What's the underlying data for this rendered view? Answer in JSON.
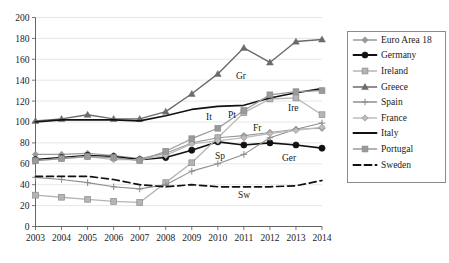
{
  "chart_data": {
    "type": "line",
    "title": "",
    "xlabel": "",
    "ylabel": "",
    "categories": [
      "2003",
      "2004",
      "2005",
      "2006",
      "2007",
      "2008",
      "2009",
      "2010",
      "2011",
      "2012",
      "2013",
      "2014"
    ],
    "x": [
      2003,
      2004,
      2005,
      2006,
      2007,
      2008,
      2009,
      2010,
      2011,
      2012,
      2013,
      2014
    ],
    "ylim": [
      0,
      200
    ],
    "ytick_step": 20,
    "yticks": [
      0,
      20,
      40,
      60,
      80,
      100,
      120,
      140,
      160,
      180,
      200
    ],
    "grid": true,
    "legend_position": "right",
    "series": [
      {
        "name": "Euro Area 18",
        "short": "",
        "color": "#9a9a9a",
        "marker": "diamond",
        "dash": "none",
        "width": 1.1,
        "values": [
          69,
          69,
          70,
          68,
          65,
          70,
          80,
          85,
          87,
          90,
          93,
          94
        ]
      },
      {
        "name": "Germany",
        "short": "Ger",
        "color": "#111111",
        "marker": "circle",
        "dash": "none",
        "width": 1.6,
        "values": [
          64,
          66,
          68,
          67,
          64,
          66,
          73,
          81,
          78,
          80,
          78,
          75
        ]
      },
      {
        "name": "Ireland",
        "short": "Ire",
        "color": "#b5b5b5",
        "marker": "square",
        "dash": "none",
        "width": 1.3,
        "values": [
          30,
          28,
          26,
          24,
          23,
          42,
          61,
          85,
          109,
          122,
          123,
          107
        ]
      },
      {
        "name": "Greece",
        "short": "Gr",
        "color": "#6b6b6b",
        "marker": "triangle",
        "dash": "none",
        "width": 1.4,
        "values": [
          101,
          103,
          107,
          103,
          103,
          110,
          127,
          146,
          171,
          157,
          177,
          179
        ]
      },
      {
        "name": "Spain",
        "short": "Sp",
        "color": "#8f8f8f",
        "marker": "plus",
        "dash": "none",
        "width": 1.1,
        "values": [
          47,
          45,
          42,
          38,
          36,
          40,
          53,
          60,
          69,
          85,
          93,
          99
        ]
      },
      {
        "name": "France",
        "short": "Fr",
        "color": "#bdbdbd",
        "marker": "diamond",
        "dash": "none",
        "width": 1.3,
        "values": [
          63,
          65,
          67,
          64,
          64,
          68,
          79,
          82,
          85,
          89,
          92,
          95
        ]
      },
      {
        "name": "Italy",
        "short": "It",
        "color": "#111111",
        "marker": "none",
        "dash": "none",
        "width": 1.7,
        "values": [
          100,
          102,
          102,
          102,
          101,
          106,
          112,
          115,
          116,
          123,
          128,
          132
        ]
      },
      {
        "name": "Portugal",
        "short": "Pt",
        "color": "#9a9a9a",
        "marker": "square",
        "dash": "none",
        "width": 1.3,
        "values": [
          63,
          65,
          67,
          66,
          63,
          72,
          84,
          94,
          111,
          126,
          129,
          130
        ]
      },
      {
        "name": "Sweden",
        "short": "Sw",
        "color": "#111111",
        "marker": "none",
        "dash": "dashed",
        "width": 1.7,
        "values": [
          48,
          48,
          48,
          45,
          40,
          38,
          40,
          38,
          38,
          38,
          39,
          44
        ]
      }
    ],
    "annotations": [
      {
        "text": "Gr",
        "x": 236,
        "y": 79
      },
      {
        "text": "It",
        "x": 206,
        "y": 120
      },
      {
        "text": "Pt",
        "x": 228,
        "y": 118
      },
      {
        "text": "Fr",
        "x": 253,
        "y": 131
      },
      {
        "text": "Ire",
        "x": 288,
        "y": 111
      },
      {
        "text": "Sp",
        "x": 215,
        "y": 159
      },
      {
        "text": "Ger",
        "x": 282,
        "y": 161
      },
      {
        "text": "Sw",
        "x": 238,
        "y": 198
      }
    ]
  },
  "legend": {
    "items": [
      {
        "label": "Euro Area 18"
      },
      {
        "label": "Germany"
      },
      {
        "label": "Ireland"
      },
      {
        "label": "Greece"
      },
      {
        "label": "Spain"
      },
      {
        "label": "France"
      },
      {
        "label": "Italy"
      },
      {
        "label": "Portugal"
      },
      {
        "label": "Sweden"
      }
    ]
  }
}
